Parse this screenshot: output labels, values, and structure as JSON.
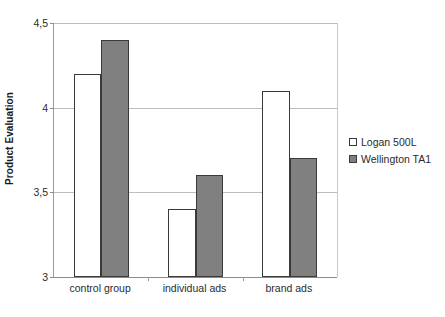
{
  "chart_data": {
    "type": "bar",
    "title": "",
    "subtitle": "",
    "xlabel": "",
    "ylabel": "Product Evaluation",
    "categories": [
      "control group",
      "individual ads",
      "brand ads"
    ],
    "series": [
      {
        "name": "Logan 500L",
        "values": [
          4.2,
          3.4,
          4.1
        ],
        "color": "#ffffff"
      },
      {
        "name": "Wellington TA1",
        "values": [
          4.4,
          3.6,
          3.7
        ],
        "color": "#808080"
      }
    ],
    "ylim": [
      3,
      4.5
    ],
    "yticks": [
      3,
      3.5,
      4,
      4.5
    ],
    "ytick_labels": [
      "3",
      "3,5",
      "4",
      "4,5"
    ],
    "grid": true,
    "legend_position": "right",
    "decimal_separator": ","
  }
}
